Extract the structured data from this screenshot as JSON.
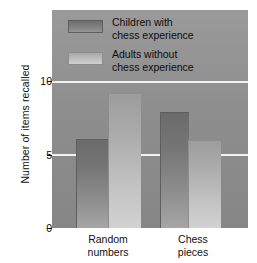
{
  "chart_data": {
    "type": "bar",
    "title": "",
    "xlabel": "",
    "ylabel": "Number of items recalled",
    "categories": [
      "Random numbers",
      "Chess pieces"
    ],
    "category_lines": [
      [
        "Random",
        "numbers"
      ],
      [
        "Chess",
        "pieces"
      ]
    ],
    "series": [
      {
        "name": "Children with chess experience",
        "name_lines": [
          "Children with",
          "chess experience"
        ],
        "color": "#757575",
        "values": [
          6.0,
          7.8
        ]
      },
      {
        "name": "Adults without chess experience",
        "name_lines": [
          "Adults without",
          "chess experience"
        ],
        "color": "#c0c0c0",
        "values": [
          9.1,
          5.9
        ]
      }
    ],
    "ylim": [
      0,
      14.8
    ],
    "yticks": [
      0,
      5,
      10
    ],
    "ytick_labels": [
      "0",
      "5",
      "10"
    ],
    "grid": true,
    "gridlines_at": [
      5,
      10
    ],
    "gridline_color": "#f2f2f2",
    "legend_position": "top-left-inside",
    "plot_background": "#8e8e8e"
  }
}
